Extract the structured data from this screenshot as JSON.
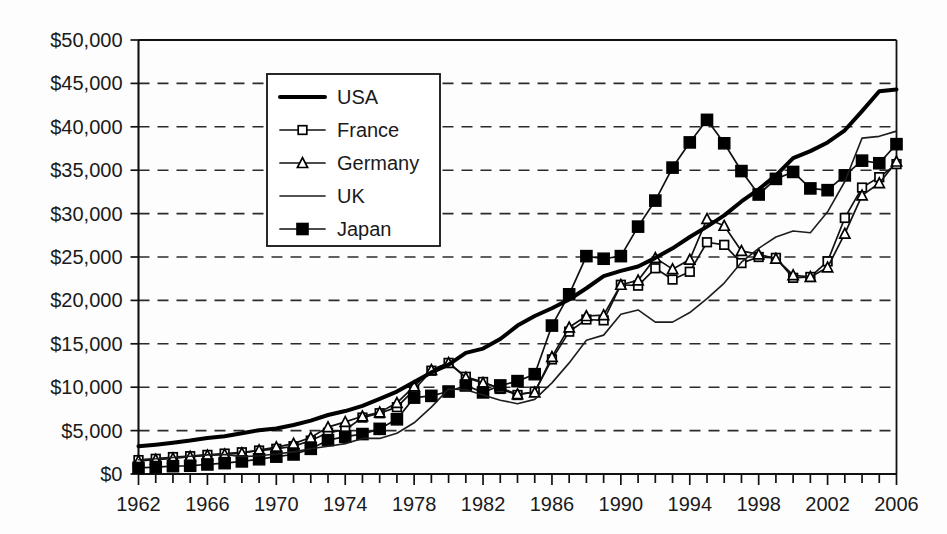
{
  "chart_data": {
    "type": "line",
    "title": "",
    "subtitle": "",
    "xlabel": "",
    "ylabel": "",
    "xlim": [
      1962,
      2006
    ],
    "ylim": [
      0,
      50000
    ],
    "grid": true,
    "grid_axis": "y",
    "legend_position": "upper-left-inside",
    "y_tick_labels": [
      "$0",
      "$5,000",
      "$10,000",
      "$15,000",
      "$20,000",
      "$25,000",
      "$30,000",
      "$35,000",
      "$40,000",
      "$45,000",
      "$50,000"
    ],
    "y_tick_values": [
      0,
      5000,
      10000,
      15000,
      20000,
      25000,
      30000,
      35000,
      40000,
      45000,
      50000
    ],
    "x_tick_labels": [
      "1962",
      "1966",
      "1970",
      "1974",
      "1978",
      "1982",
      "1986",
      "1990",
      "1994",
      "1998",
      "2002",
      "2006"
    ],
    "x_tick_values": [
      1962,
      1966,
      1970,
      1974,
      1978,
      1982,
      1986,
      1990,
      1994,
      1998,
      2002,
      2006
    ],
    "x_minor_tick_step": 1,
    "x": [
      1962,
      1963,
      1964,
      1965,
      1966,
      1967,
      1968,
      1969,
      1970,
      1971,
      1972,
      1973,
      1974,
      1975,
      1976,
      1977,
      1978,
      1979,
      1980,
      1981,
      1982,
      1983,
      1984,
      1985,
      1986,
      1987,
      1988,
      1989,
      1990,
      1991,
      1992,
      1993,
      1994,
      1995,
      1996,
      1997,
      1998,
      1999,
      2000,
      2001,
      2002,
      2003,
      2004,
      2005,
      2006
    ],
    "series": [
      {
        "name": "USA",
        "style": "thick-line",
        "marker": "none",
        "color": "#000000",
        "values": [
          3200,
          3380,
          3600,
          3850,
          4150,
          4350,
          4700,
          5050,
          5250,
          5650,
          6150,
          6800,
          7250,
          7850,
          8650,
          9500,
          10600,
          11700,
          12600,
          13950,
          14450,
          15550,
          17100,
          18200,
          19100,
          20100,
          21400,
          22800,
          23400,
          23900,
          24900,
          26000,
          27300,
          28500,
          29800,
          31400,
          32800,
          34400,
          36400,
          37200,
          38200,
          39600,
          41800,
          44100,
          44300
        ]
      },
      {
        "name": "France",
        "style": "line-marker",
        "marker": "open-square",
        "color": "#000000",
        "values": [
          1600,
          1750,
          1950,
          2050,
          2200,
          2350,
          2500,
          2700,
          2900,
          3200,
          3850,
          4750,
          5100,
          6500,
          7000,
          7700,
          9700,
          11900,
          12800,
          11200,
          10600,
          9800,
          9100,
          9500,
          13200,
          16400,
          17800,
          17700,
          21800,
          21700,
          23700,
          22400,
          23300,
          26700,
          26400,
          24300,
          25000,
          24900,
          22600,
          22700,
          24500,
          29500,
          33000,
          34200,
          35700
        ]
      },
      {
        "name": "Germany",
        "style": "line-marker",
        "marker": "open-triangle",
        "color": "#000000",
        "values": [
          1500,
          1650,
          1800,
          2000,
          2150,
          2250,
          2400,
          2750,
          3100,
          3500,
          4200,
          5400,
          6000,
          6650,
          7100,
          8200,
          10100,
          12000,
          12800,
          11100,
          10500,
          9900,
          9200,
          9400,
          13500,
          16900,
          18200,
          18300,
          21800,
          22300,
          24900,
          23600,
          24700,
          29400,
          28600,
          25700,
          25300,
          24800,
          22900,
          22700,
          23800,
          27700,
          32100,
          33500,
          36000
        ]
      },
      {
        "name": "UK",
        "style": "thin-line",
        "marker": "none",
        "color": "#1d1d1d",
        "values": [
          1650,
          1750,
          1900,
          2050,
          2200,
          2250,
          2000,
          2100,
          2300,
          2550,
          2900,
          3200,
          3500,
          4100,
          4100,
          4700,
          5900,
          7700,
          9800,
          9700,
          9100,
          8500,
          8100,
          8600,
          10500,
          12800,
          15400,
          16000,
          18400,
          18900,
          17500,
          17500,
          18600,
          20200,
          22000,
          24400,
          26000,
          27300,
          28000,
          27800,
          30200,
          33700,
          38700,
          38900,
          39500
        ]
      },
      {
        "name": "Japan",
        "style": "line-marker",
        "marker": "filled-square",
        "color": "#000000",
        "values": [
          700,
          800,
          900,
          950,
          1100,
          1250,
          1450,
          1700,
          2000,
          2250,
          2900,
          3900,
          4300,
          4600,
          5200,
          6300,
          8800,
          9000,
          9500,
          10200,
          9400,
          10200,
          10700,
          11500,
          17100,
          20700,
          25100,
          24800,
          25100,
          28500,
          31500,
          35300,
          38200,
          40800,
          38100,
          34900,
          32200,
          34000,
          34800,
          32900,
          32700,
          34400,
          36100,
          35800,
          38000
        ]
      }
    ],
    "legend": [
      {
        "label": "USA",
        "style": "thick-line",
        "marker": "none"
      },
      {
        "label": "France",
        "style": "line-marker",
        "marker": "open-square"
      },
      {
        "label": "Germany",
        "style": "line-marker",
        "marker": "open-triangle"
      },
      {
        "label": "UK",
        "style": "thin-line",
        "marker": "none"
      },
      {
        "label": "Japan",
        "style": "line-marker",
        "marker": "filled-square"
      }
    ]
  }
}
